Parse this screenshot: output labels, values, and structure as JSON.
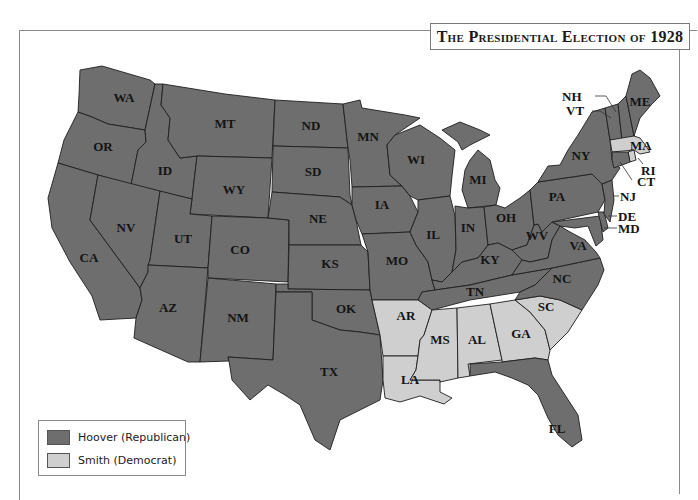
{
  "title": "The Presidential Election of 1928",
  "colors": {
    "hoover": "#6e6e6e",
    "smith": "#cfcfcf",
    "background": "#ffffff",
    "border": "#1e1e1e"
  },
  "legend": {
    "items": [
      {
        "label": "Hoover (Republican)",
        "color_key": "hoover"
      },
      {
        "label": "Smith (Democrat)",
        "color_key": "smith"
      }
    ]
  },
  "states": {
    "WA": {
      "label": "WA",
      "winner": "hoover"
    },
    "OR": {
      "label": "OR",
      "winner": "hoover"
    },
    "CA": {
      "label": "CA",
      "winner": "hoover"
    },
    "ID": {
      "label": "ID",
      "winner": "hoover"
    },
    "NV": {
      "label": "NV",
      "winner": "hoover"
    },
    "MT": {
      "label": "MT",
      "winner": "hoover"
    },
    "WY": {
      "label": "WY",
      "winner": "hoover"
    },
    "UT": {
      "label": "UT",
      "winner": "hoover"
    },
    "AZ": {
      "label": "AZ",
      "winner": "hoover"
    },
    "CO": {
      "label": "CO",
      "winner": "hoover"
    },
    "NM": {
      "label": "NM",
      "winner": "hoover"
    },
    "ND": {
      "label": "ND",
      "winner": "hoover"
    },
    "SD": {
      "label": "SD",
      "winner": "hoover"
    },
    "NE": {
      "label": "NE",
      "winner": "hoover"
    },
    "KS": {
      "label": "KS",
      "winner": "hoover"
    },
    "OK": {
      "label": "OK",
      "winner": "hoover"
    },
    "TX": {
      "label": "TX",
      "winner": "hoover"
    },
    "MN": {
      "label": "MN",
      "winner": "hoover"
    },
    "IA": {
      "label": "IA",
      "winner": "hoover"
    },
    "MO": {
      "label": "MO",
      "winner": "hoover"
    },
    "AR": {
      "label": "AR",
      "winner": "smith"
    },
    "LA": {
      "label": "LA",
      "winner": "smith"
    },
    "WI": {
      "label": "WI",
      "winner": "hoover"
    },
    "IL": {
      "label": "IL",
      "winner": "hoover"
    },
    "MI": {
      "label": "MI",
      "winner": "hoover"
    },
    "IN": {
      "label": "IN",
      "winner": "hoover"
    },
    "OH": {
      "label": "OH",
      "winner": "hoover"
    },
    "KY": {
      "label": "KY",
      "winner": "hoover"
    },
    "TN": {
      "label": "TN",
      "winner": "hoover"
    },
    "MS": {
      "label": "MS",
      "winner": "smith"
    },
    "AL": {
      "label": "AL",
      "winner": "smith"
    },
    "GA": {
      "label": "GA",
      "winner": "smith"
    },
    "FL": {
      "label": "FL",
      "winner": "hoover"
    },
    "SC": {
      "label": "SC",
      "winner": "smith"
    },
    "NC": {
      "label": "NC",
      "winner": "hoover"
    },
    "VA": {
      "label": "VA",
      "winner": "hoover"
    },
    "WV": {
      "label": "WV",
      "winner": "hoover"
    },
    "PA": {
      "label": "PA",
      "winner": "hoover"
    },
    "NY": {
      "label": "NY",
      "winner": "hoover"
    },
    "VT": {
      "label": "VT",
      "winner": "hoover"
    },
    "NH": {
      "label": "NH",
      "winner": "hoover"
    },
    "ME": {
      "label": "ME",
      "winner": "hoover"
    },
    "MA": {
      "label": "MA",
      "winner": "smith"
    },
    "RI": {
      "label": "RI",
      "winner": "smith"
    },
    "CT": {
      "label": "CT",
      "winner": "hoover"
    },
    "NJ": {
      "label": "NJ",
      "winner": "hoover"
    },
    "DE": {
      "label": "DE",
      "winner": "hoover"
    },
    "MD": {
      "label": "MD",
      "winner": "hoover"
    }
  }
}
